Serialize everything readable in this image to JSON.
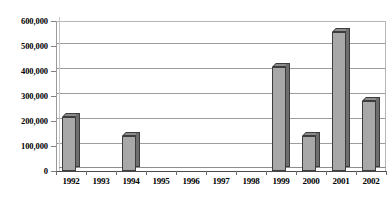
{
  "chart_data": {
    "type": "bar",
    "title": "",
    "subtitle": "",
    "xlabel": "",
    "ylabel": "",
    "categories": [
      "1992",
      "1993",
      "1994",
      "1995",
      "1996",
      "1997",
      "1998",
      "1999",
      "2000",
      "2001",
      "2002"
    ],
    "values": [
      215000,
      0,
      140000,
      0,
      0,
      0,
      0,
      415000,
      140000,
      555000,
      280000
    ],
    "ylim": [
      0,
      600000
    ],
    "ytick_values": [
      0,
      100000,
      200000,
      300000,
      400000,
      500000,
      600000
    ],
    "ytick_labels": [
      "0",
      "100,000",
      "200,000",
      "300,000",
      "400,000",
      "500,000",
      "600,000"
    ],
    "grid": true,
    "grid_axis": "y",
    "legend": false,
    "legend_position": "none",
    "style": "3d-column",
    "series": [
      {
        "name": "Series 1",
        "values": [
          215000,
          0,
          140000,
          0,
          0,
          0,
          0,
          415000,
          140000,
          555000,
          280000
        ]
      }
    ],
    "colors": {
      "bar_front": "#a8a8a8",
      "bar_side": "#6e6e6e",
      "bar_top": "#8c8c8c",
      "bar_outline": "#3d3d3d",
      "gridline": "#9d9d9d",
      "axis": "#4a4a4a",
      "text": "#000000",
      "background": "#ffffff"
    }
  }
}
